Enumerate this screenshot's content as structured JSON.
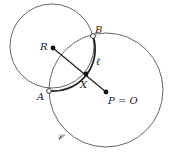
{
  "diagram": {
    "type": "geometry",
    "circles": {
      "small": {
        "cx": 52,
        "cy": 46,
        "r": 42,
        "color": "#555555"
      },
      "big": {
        "cx": 106,
        "cy": 90,
        "r": 57,
        "color": "#555555",
        "label": "𝒞"
      }
    },
    "arc_l": {
      "label": "ℓ",
      "color": "#222222"
    },
    "points": {
      "A": {
        "x": 49,
        "y": 91,
        "label": "A",
        "style": "open"
      },
      "B": {
        "x": 93,
        "y": 36,
        "label": "B",
        "style": "open"
      },
      "R": {
        "x": 53,
        "y": 48,
        "label": "R",
        "style": "filled"
      },
      "X": {
        "x": 86,
        "y": 74,
        "label": "X",
        "style": "filled"
      },
      "P": {
        "x": 106,
        "y": 92,
        "label": "P = O",
        "style": "filled"
      }
    },
    "segment": {
      "from": "R",
      "to": "P",
      "color": "#222222"
    }
  }
}
